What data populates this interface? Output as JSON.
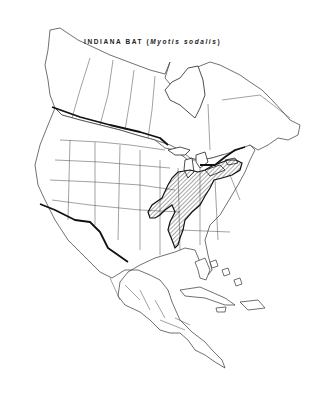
{
  "map": {
    "title_common": "INDIANA BAT",
    "title_open": "(",
    "title_scientific": "Myotis sodalis",
    "title_close": ")",
    "region": "North America",
    "range_fill": "diagonal hatching",
    "range_color": "#111111",
    "background": "#ffffff",
    "range_description": "Eastern United States: from Oklahoma/Arkansas/Missouri east through Illinois, Indiana, Ohio, Kentucky, Tennessee, to Pennsylvania, New York, Vermont, with southern extension into northern Alabama"
  }
}
